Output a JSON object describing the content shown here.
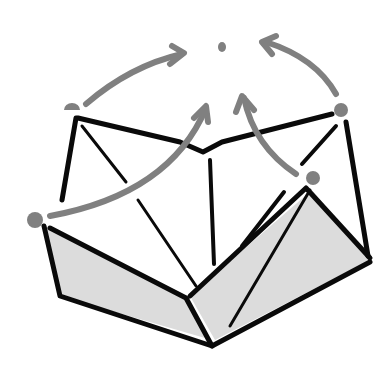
{
  "diagram": {
    "type": "origami-fold-diagram",
    "colors": {
      "ink": "#0a0a0a",
      "arrow": "#808080",
      "shade": "#dcdcdc",
      "background": "#ffffff"
    },
    "target_point": {
      "x": 222,
      "y": 46
    },
    "corner_points": [
      {
        "name": "left-top-corner",
        "x": 72,
        "y": 106
      },
      {
        "name": "right-top-corner",
        "x": 340,
        "y": 110
      },
      {
        "name": "left-bottom-corner",
        "x": 36,
        "y": 220
      },
      {
        "name": "right-bottom-corner",
        "x": 312,
        "y": 178
      }
    ],
    "arrows": [
      {
        "from": "left-top-corner",
        "to": "target_point"
      },
      {
        "from": "right-top-corner",
        "to": "target_point"
      },
      {
        "from": "left-bottom-corner",
        "to": "target_point"
      },
      {
        "from": "right-bottom-corner",
        "to": "target_point"
      }
    ]
  }
}
